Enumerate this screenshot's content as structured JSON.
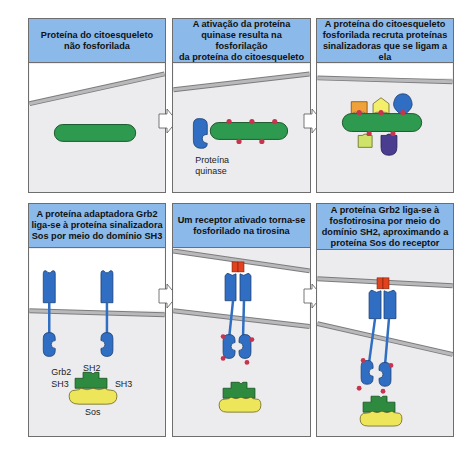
{
  "colors": {
    "caption_bg": "#8ab9ea",
    "panel_bg": "#ececee",
    "extracellular_bg": "#ffffff",
    "membrane": "#a9a9ab",
    "cytoskeleton_protein": "#2e9a4f",
    "kinase": "#2f6ec2",
    "phosphate": "#c8334d",
    "receptor_top": "#e2431e",
    "grb2": "#2e8a3e",
    "sos": "#eee65a",
    "orange_protein": "#f0a23a",
    "yellow_protein": "#f4ef6a",
    "blue_protein": "#2f6ec2",
    "lime_protein": "#cfe36a",
    "purple_protein": "#4a3c8f"
  },
  "panels": [
    {
      "id": 1,
      "caption": "Proteína do citoesqueleto\nnão fosforilada",
      "labels": []
    },
    {
      "id": 2,
      "caption": "A ativação da proteína\nquinase resulta na fosforilação\nda proteína do citoesqueleto",
      "labels": [
        "Proteína",
        "quinase"
      ]
    },
    {
      "id": 3,
      "caption": "A proteína do citoesqueleto\nfosforilada recruta proteínas\nsinalizadoras que se ligam a ela",
      "labels": []
    },
    {
      "id": 4,
      "caption": "A proteína adaptadora Grb2\nliga-se à proteína sinalizadora\nSos por meio do domínio SH3",
      "labels": [
        "Grb2",
        "SH2",
        "SH3",
        "SH3",
        "Sos"
      ]
    },
    {
      "id": 5,
      "caption": "Um receptor ativado torna-se\nfosforilado na tirosina",
      "labels": []
    },
    {
      "id": 6,
      "caption": "A proteína Grb2 liga-se à\nfosfotirosina por meio do\ndomínio SH2, aproximando a\nproteína Sos do receptor",
      "labels": []
    }
  ]
}
